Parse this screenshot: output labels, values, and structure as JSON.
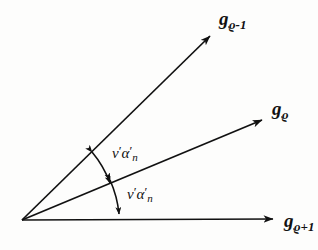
{
  "figure": {
    "type": "vector-angle-diagram",
    "background_color": "#fdfdfc",
    "stroke_color": "#111111",
    "origin": {
      "x": 22,
      "y": 220
    },
    "vectors": [
      {
        "name": "g-rho-minus-1",
        "label_base": "g",
        "label_sub": "ϱ-1",
        "from": {
          "x": 22,
          "y": 220
        },
        "to": {
          "x": 216,
          "y": 31
        }
      },
      {
        "name": "g-rho",
        "label_base": "g",
        "label_sub": "ϱ",
        "from": {
          "x": 22,
          "y": 220
        },
        "to": {
          "x": 269,
          "y": 117
        }
      },
      {
        "name": "g-rho-plus-1",
        "label_base": "g",
        "label_sub": "ϱ+1",
        "from": {
          "x": 22,
          "y": 220
        },
        "to": {
          "x": 281,
          "y": 219
        }
      }
    ],
    "angles": [
      {
        "name": "angle-upper",
        "text_nu": "ν",
        "prime_1": "′",
        "text_alpha": "α",
        "prime_2": "′",
        "sub_n": "n",
        "between": [
          "g-rho-minus-1",
          "g-rho"
        ]
      },
      {
        "name": "angle-lower",
        "text_nu": "ν",
        "prime_1": "′",
        "text_alpha": "α",
        "prime_2": "′",
        "sub_n": "n",
        "between": [
          "g-rho",
          "g-rho-plus-1"
        ]
      }
    ]
  }
}
